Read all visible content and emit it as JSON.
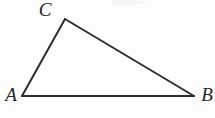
{
  "figure": {
    "kind": "geometry-diagram",
    "shape": "triangle",
    "width": 215,
    "height": 118,
    "background_color": "#fdfdfd",
    "stroke_color": "#2e2e2e",
    "stroke_width": 2,
    "vertices": [
      {
        "name": "A",
        "label": "A",
        "x": 22,
        "y": 96,
        "label_x": 11,
        "label_y": 94
      },
      {
        "name": "B",
        "label": "B",
        "x": 194,
        "y": 96,
        "label_x": 207,
        "label_y": 94
      },
      {
        "name": "C",
        "label": "C",
        "x": 65,
        "y": 19,
        "label_x": 45,
        "label_y": 9
      }
    ],
    "edges": [
      {
        "name": "AB",
        "from": "A",
        "to": "B",
        "x1": 22,
        "y1": 96,
        "x2": 194,
        "y2": 96
      },
      {
        "name": "AC",
        "from": "A",
        "to": "C",
        "x1": 22,
        "y1": 96,
        "x2": 65,
        "y2": 19
      },
      {
        "name": "CB",
        "from": "C",
        "to": "B",
        "x1": 65,
        "y1": 19,
        "x2": 194,
        "y2": 96
      }
    ],
    "artifacts": [
      {
        "name": "scan-smudge-top",
        "x": 112,
        "y": 0,
        "width": 26,
        "height": 5,
        "color": "#f4f4f4"
      }
    ]
  }
}
